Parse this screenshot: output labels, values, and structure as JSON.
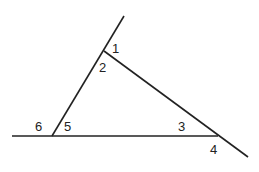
{
  "diagram": {
    "type": "triangle-angles",
    "line_color": "#222222",
    "lines": [
      {
        "name": "left-transversal",
        "x1": 52,
        "y1": 136,
        "x2": 124,
        "y2": 16
      },
      {
        "name": "base-line",
        "x1": 12,
        "y1": 136,
        "x2": 218,
        "y2": 136
      },
      {
        "name": "right-transversal",
        "x1": 104,
        "y1": 51,
        "x2": 248,
        "y2": 157
      }
    ],
    "labels": [
      {
        "text": "1",
        "x": 112,
        "y": 42
      },
      {
        "text": "2",
        "x": 99,
        "y": 61
      },
      {
        "text": "3",
        "x": 178,
        "y": 120
      },
      {
        "text": "4",
        "x": 210,
        "y": 143
      },
      {
        "text": "5",
        "x": 64,
        "y": 120
      },
      {
        "text": "6",
        "x": 35,
        "y": 120
      }
    ]
  }
}
